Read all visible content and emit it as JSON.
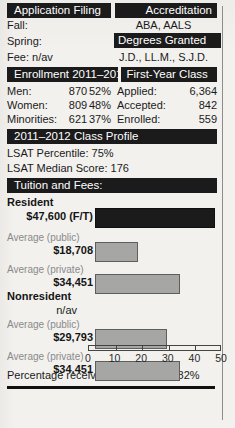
{
  "sections": {
    "application_filing": {
      "heading": "Application Filing",
      "rows": [
        {
          "label": "Fall:"
        },
        {
          "label": "Spring:"
        },
        {
          "label": "Fee: n/av"
        }
      ]
    },
    "accreditation": {
      "heading": "Accreditation",
      "value": "ABA, AALS"
    },
    "degrees_granted": {
      "heading": "Degrees Granted",
      "value": "J.D., LL.M., S.J.D."
    },
    "enrollment": {
      "heading": "Enrollment 2011–2012",
      "rows": [
        {
          "label": "Men:",
          "count": "870",
          "percent": "52%"
        },
        {
          "label": "Women:",
          "count": "809",
          "percent": "48%"
        },
        {
          "label": "Minorities:",
          "count": "621",
          "percent": "37%"
        }
      ]
    },
    "first_year_class": {
      "heading": "First-Year Class",
      "rows": [
        {
          "label": "Applied:",
          "value": "6,364"
        },
        {
          "label": "Accepted:",
          "value": "842"
        },
        {
          "label": "Enrolled:",
          "value": "559"
        }
      ]
    },
    "class_profile": {
      "heading": "2011–2012 Class Profile",
      "rows": [
        "LSAT Percentile: 75%",
        "LSAT Median Score: 176"
      ]
    },
    "tuition": {
      "heading": "Tuition and Fees:",
      "footer": "Percentage receiving financial aid: 82%"
    }
  },
  "chart_data": {
    "type": "bar",
    "title": "Tuition and Fees:",
    "xlabel": "",
    "ylabel": "",
    "orientation": "horizontal",
    "xlim": [
      0,
      50
    ],
    "x_tick_labels": [
      "0",
      "10",
      "20",
      "30",
      "40",
      "50"
    ],
    "x_ticks": [
      0,
      10,
      20,
      30,
      40,
      50
    ],
    "unit": "thousands of dollars",
    "grid": false,
    "legend": null,
    "groups": [
      {
        "group_label": "Resident",
        "bars": [
          {
            "sub_label": "",
            "display_value": "$47,600 (F/T)",
            "value": 47.6,
            "color": "#1b1b1b",
            "style": "dark"
          },
          {
            "sub_label": "Average (public)",
            "display_value": "$18,708",
            "value": 18.708,
            "color": "#a6a6a4",
            "style": "gray"
          },
          {
            "sub_label": "Average (private)",
            "display_value": "$34,451",
            "value": 34.451,
            "color": "#a6a6a4",
            "style": "gray"
          }
        ]
      },
      {
        "group_label": "Nonresident",
        "bars": [
          {
            "sub_label": "",
            "display_value": "n/av",
            "value": null,
            "color": null,
            "style": "none"
          },
          {
            "sub_label": "Average (public)",
            "display_value": "$29,793",
            "value": 29.793,
            "color": "#a6a6a4",
            "style": "gray"
          },
          {
            "sub_label": "Average (private)",
            "display_value": "$34,451",
            "value": 34.451,
            "color": "#a6a6a4",
            "style": "gray"
          }
        ]
      }
    ],
    "annotation": "Percentage receiving financial aid: 82%"
  },
  "colors": {
    "header_bar_bg": "#1b1b1b",
    "header_bar_text": "#ffffff",
    "page_bg": "#f2f1ee",
    "bar_dark": "#1b1b1b",
    "bar_gray": "#a6a6a4",
    "muted_text": "#8a8a8a"
  }
}
